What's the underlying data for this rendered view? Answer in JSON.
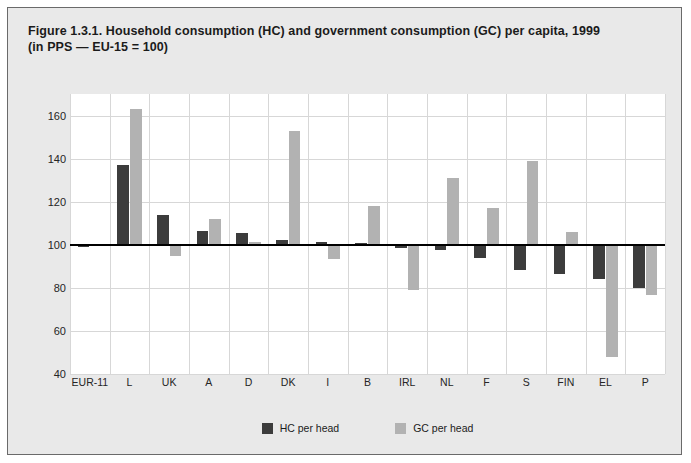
{
  "figure": {
    "title_line1": "Figure 1.3.1. Household consumption (HC) and government consumption (GC) per capita, 1999",
    "title_line2": "(in PPS — EU-15 = 100)",
    "frame_bg": "#e9e9e9",
    "plot_bg": "#ffffff"
  },
  "chart_data": {
    "type": "bar",
    "title": "Figure 1.3.1. Household consumption (HC) and government consumption (GC) per capita, 1999 (in PPS — EU-15 = 100)",
    "xlabel": "",
    "ylabel": "",
    "ylim": [
      40,
      170
    ],
    "yticks": [
      40,
      60,
      80,
      100,
      120,
      140,
      160
    ],
    "ytick_labels": [
      "40",
      "60",
      "80",
      "100",
      "120",
      "140",
      "160"
    ],
    "baseline": 100,
    "grid": true,
    "legend_position": "bottom-center",
    "categories": [
      "EUR-11",
      "L",
      "UK",
      "A",
      "D",
      "DK",
      "I",
      "B",
      "IRL",
      "NL",
      "F",
      "S",
      "FIN",
      "EL",
      "P"
    ],
    "series": [
      {
        "name": "HC per head",
        "color": "#3c3c3c",
        "values": [
          99,
          137,
          114,
          106.5,
          105.5,
          102,
          101.5,
          101,
          98.5,
          97.5,
          94,
          88.5,
          86.5,
          84,
          80
        ]
      },
      {
        "name": "GC per head",
        "color": "#b2b2b2",
        "values": [
          99.5,
          163,
          95,
          112,
          101.5,
          153,
          93.5,
          118,
          79,
          131,
          117,
          139,
          106,
          48,
          76.5
        ]
      }
    ]
  },
  "legend": {
    "entries": [
      {
        "label": "HC per head",
        "color": "#3c3c3c"
      },
      {
        "label": "GC per head",
        "color": "#b2b2b2"
      }
    ]
  }
}
